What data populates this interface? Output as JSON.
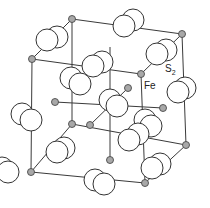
{
  "diagram": {
    "type": "crystal-structure",
    "labels": {
      "fe": "Fe",
      "s2_main": "S",
      "s2_sub": "2"
    },
    "legend_positions": {
      "fe": {
        "x": 144,
        "y": 90
      },
      "s2": {
        "x": 166,
        "y": 72
      }
    },
    "colors": {
      "fe_fill": "#a8a8a8",
      "s_fill": "#ffffff",
      "bond": "#3a3a3a"
    },
    "fe_atoms": [
      {
        "x": 72,
        "y": 19
      },
      {
        "x": 182,
        "y": 34
      },
      {
        "x": 32,
        "y": 59
      },
      {
        "x": 141,
        "y": 74
      },
      {
        "x": 108,
        "y": 47
      },
      {
        "x": 82,
        "y": 98
      },
      {
        "x": 55,
        "y": 102
      },
      {
        "x": 128,
        "y": 88
      },
      {
        "x": 53,
        "y": 124
      },
      {
        "x": 110,
        "y": 134
      },
      {
        "x": 90,
        "y": 158
      },
      {
        "x": 68,
        "y": 148
      },
      {
        "x": 163,
        "y": 108
      },
      {
        "x": 186,
        "y": 145
      },
      {
        "x": 31,
        "y": 172
      },
      {
        "x": 145,
        "y": 183
      },
      {
        "x": 118,
        "y": 110
      }
    ],
    "s2_dimers": [
      {
        "a": {
          "x": 47,
          "y": 40
        },
        "b": {
          "x": 57,
          "y": 37
        }
      },
      {
        "a": {
          "x": 124,
          "y": 26
        },
        "b": {
          "x": 133,
          "y": 20
        }
      },
      {
        "a": {
          "x": 157,
          "y": 54
        },
        "b": {
          "x": 166,
          "y": 50
        }
      },
      {
        "a": {
          "x": 93,
          "y": 66
        },
        "b": {
          "x": 102,
          "y": 62
        }
      },
      {
        "a": {
          "x": 71,
          "y": 78
        },
        "b": {
          "x": 80,
          "y": 84
        }
      },
      {
        "a": {
          "x": 110,
          "y": 100
        },
        "b": {
          "x": 117,
          "y": 106
        }
      },
      {
        "a": {
          "x": 178,
          "y": 92
        },
        "b": {
          "x": 185,
          "y": 88
        }
      },
      {
        "a": {
          "x": 22,
          "y": 114
        },
        "b": {
          "x": 31,
          "y": 120
        }
      },
      {
        "a": {
          "x": 145,
          "y": 120
        },
        "b": {
          "x": 151,
          "y": 126
        }
      },
      {
        "a": {
          "x": 129,
          "y": 140
        },
        "b": {
          "x": 138,
          "y": 134
        }
      },
      {
        "a": {
          "x": 57,
          "y": 152
        },
        "b": {
          "x": 64,
          "y": 148
        }
      },
      {
        "a": {
          "x": 2,
          "y": 168
        },
        "b": {
          "x": 8,
          "y": 172
        }
      },
      {
        "a": {
          "x": 95,
          "y": 180
        },
        "b": {
          "x": 104,
          "y": 184
        }
      },
      {
        "a": {
          "x": 152,
          "y": 168
        },
        "b": {
          "x": 160,
          "y": 164
        }
      }
    ]
  }
}
